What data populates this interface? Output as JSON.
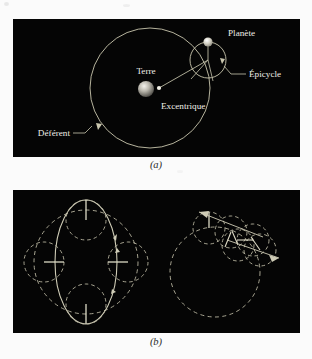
{
  "figure": {
    "background_color": "#fbfbfb",
    "panel_background": "#050505",
    "stroke_color": "#c9c6ae",
    "label_color": "#efeee8"
  },
  "panel_a": {
    "caption": "(a)",
    "labels": {
      "planet": "Planète",
      "epicycle": "Épicycle",
      "earth": "Terre",
      "eccentric": "Excentrique",
      "deferent": "Déférent"
    },
    "geometry": {
      "deferent_center_x": 150,
      "deferent_center_y": 88,
      "deferent_radius": 60,
      "epicycle_center_x": 208,
      "epicycle_center_y": 60,
      "epicycle_radius": 18,
      "planet_x": 208,
      "planet_y": 42,
      "earth_x": 146,
      "earth_y": 89,
      "earth_radius": 8,
      "eccentric_x": 159,
      "eccentric_y": 88
    }
  },
  "panel_b": {
    "caption": "(b)",
    "left_diagram": {
      "type": "ellipse-with-four-epicycles",
      "ellipse_center_x": 73,
      "ellipse_center_y": 262,
      "ellipse_rx": 31,
      "ellipse_ry": 62,
      "deferent_radius": 52,
      "epicycle_radius": 20,
      "epicycle_count": 4
    },
    "right_diagram": {
      "type": "deferent-with-epicycle-train",
      "deferent_center_x": 215,
      "deferent_center_y": 272,
      "deferent_radius": 45,
      "epicycle_radius": 16,
      "epicycle_count": 5
    }
  }
}
